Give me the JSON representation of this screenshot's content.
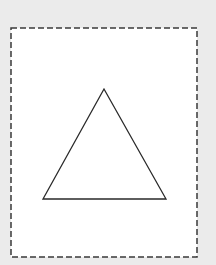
{
  "canvas": {
    "width": 216,
    "height": 265,
    "background": "#ebebeb"
  },
  "frame": {
    "shape": "dashed-rectangle",
    "x": 11,
    "y": 28,
    "width": 186,
    "height": 229,
    "fill": "#ffffff",
    "stroke": "#3a3a3a",
    "dash": "6 3"
  },
  "triangle": {
    "shape": "equilateral-triangle",
    "points": [
      [
        104,
        89
      ],
      [
        43,
        199
      ],
      [
        166,
        199
      ]
    ],
    "fill": "#ffffff",
    "stroke": "#2a2a2a"
  }
}
